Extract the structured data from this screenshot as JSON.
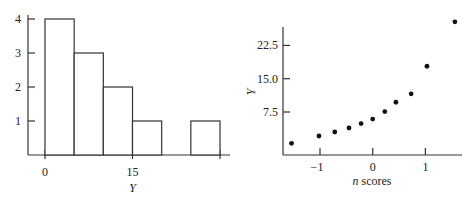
{
  "chart_data": [
    {
      "type": "bar",
      "subtype": "histogram",
      "title": "",
      "xlabel": "Y",
      "ylabel": "",
      "bin_edges": [
        0,
        5,
        10,
        15,
        20,
        25,
        30
      ],
      "categories": [
        "0-5",
        "5-10",
        "10-15",
        "15-20",
        "20-25",
        "25-30"
      ],
      "values": [
        4,
        3,
        2,
        1,
        0,
        1
      ],
      "x_ticks": [
        0,
        15,
        30
      ],
      "x_tick_labels": [
        "0",
        "15",
        ""
      ],
      "y_ticks": [
        1,
        2,
        3,
        4
      ],
      "y_tick_labels": [
        "1",
        "2",
        "3",
        "4"
      ],
      "ylim": [
        0,
        4
      ],
      "xlim": [
        0,
        30
      ],
      "grid": false,
      "legend": null
    },
    {
      "type": "scatter",
      "title": "",
      "xlabel": "n scores",
      "ylabel": "Y",
      "x": [
        -1.54,
        -1.02,
        -0.72,
        -0.45,
        -0.22,
        0.0,
        0.23,
        0.44,
        0.73,
        1.03,
        1.56
      ],
      "y": [
        0.45,
        2.1,
        3.0,
        3.9,
        4.9,
        5.9,
        7.6,
        9.7,
        11.6,
        17.8,
        27.8
      ],
      "x_ticks": [
        -1,
        0,
        1
      ],
      "x_tick_labels": [
        "−1",
        "0",
        "1"
      ],
      "y_ticks": [
        7.5,
        15.0,
        22.5
      ],
      "y_tick_labels": [
        "7.5",
        "15.0",
        "22.5"
      ],
      "xlim": [
        -1.7,
        1.6
      ],
      "ylim": [
        -2.3,
        28
      ],
      "grid": false,
      "legend": null
    }
  ],
  "histogram": {
    "xlabel": "Y",
    "y_tick_labels": [
      "1",
      "2",
      "3",
      "4"
    ],
    "x_tick_labels": [
      "0",
      "15"
    ]
  },
  "scatter": {
    "xlabel_italic": "n",
    "xlabel_rest": " scores",
    "ylabel": "Y",
    "y_tick_labels": [
      "7.5",
      "15.0",
      "22.5"
    ],
    "x_tick_labels": [
      "−1",
      "0",
      "1"
    ]
  }
}
